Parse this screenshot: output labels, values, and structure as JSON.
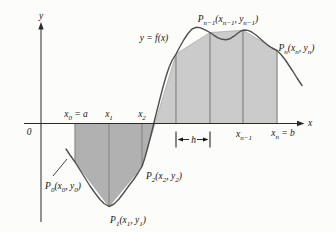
{
  "figure": {
    "colors": {
      "background": "#fcfcfa",
      "fill_below_axis": "#b1b1b1",
      "fill_above_axis": "#cbcbcb",
      "trapezoid_edge": "#8a8a8a",
      "chord_stroke": "#9a9a9a",
      "curve": "#4f4f4f",
      "axis": "#2a2a2a",
      "text": "#151515"
    },
    "axis": {
      "x_axis_y": 123.5,
      "y_axis_x": 41,
      "x_start": 24,
      "x_end": 301.5,
      "x_arrow_tip": 304.5,
      "y_bottom": 222,
      "y_top": 26,
      "y_arrow_tip": 22
    },
    "points": [
      {
        "name": "P0",
        "x": 75,
        "y": 162
      },
      {
        "name": "P1",
        "x": 109,
        "y": 206.5
      },
      {
        "name": "P2",
        "x": 142,
        "y": 166.5
      },
      {
        "name": "P3",
        "x": 176,
        "y": 54
      },
      {
        "name": "P4",
        "x": 210,
        "y": 32.5
      },
      {
        "name": "P5",
        "x": 243,
        "y": 30.3
      },
      {
        "name": "P6",
        "x": 277,
        "y": 50.5
      }
    ],
    "curve": [
      [
        66,
        149
      ],
      [
        70,
        155
      ],
      [
        75,
        162
      ],
      [
        80,
        170
      ],
      [
        85,
        178
      ],
      [
        90,
        186
      ],
      [
        95,
        193
      ],
      [
        100,
        199.5
      ],
      [
        104,
        203.5
      ],
      [
        109,
        206.5
      ],
      [
        114,
        204
      ],
      [
        119,
        199
      ],
      [
        124,
        192.5
      ],
      [
        129,
        185.5
      ],
      [
        134,
        179
      ],
      [
        138,
        173
      ],
      [
        142,
        166.5
      ],
      [
        145,
        157.5
      ],
      [
        148,
        146.5
      ],
      [
        151,
        135
      ],
      [
        154,
        122.5
      ],
      [
        157,
        110.5
      ],
      [
        160,
        98.5
      ],
      [
        163,
        87
      ],
      [
        166,
        76.5
      ],
      [
        169,
        67.5
      ],
      [
        172,
        60.5
      ],
      [
        176,
        54
      ],
      [
        180,
        46.5
      ],
      [
        184,
        39.5
      ],
      [
        188,
        33.5
      ],
      [
        192,
        29
      ],
      [
        196,
        27.3
      ],
      [
        200,
        27.6
      ],
      [
        205,
        29.8
      ],
      [
        210,
        32.5
      ],
      [
        214,
        35.3
      ],
      [
        218,
        37.8
      ],
      [
        222,
        39.3
      ],
      [
        226,
        39.7
      ],
      [
        230,
        38.7
      ],
      [
        234,
        36.2
      ],
      [
        238,
        33
      ],
      [
        241,
        31
      ],
      [
        244,
        30
      ],
      [
        248,
        30.4
      ],
      [
        252,
        32.2
      ],
      [
        256,
        35
      ],
      [
        260,
        38.5
      ],
      [
        264,
        42
      ],
      [
        268,
        45.3
      ],
      [
        272,
        48
      ],
      [
        277,
        50.5
      ],
      [
        281,
        54.5
      ],
      [
        285,
        59.5
      ],
      [
        289,
        65.5
      ],
      [
        293,
        71.5
      ],
      [
        297,
        78
      ],
      [
        300,
        82.5
      ],
      [
        302,
        85.5
      ]
    ],
    "h_marker": {
      "x1": 176,
      "x2": 210,
      "y_mid": 139.5,
      "bar_top": 131.5,
      "bar_bottom": 147.5,
      "label": "h"
    },
    "leader_line": {
      "x1": 53,
      "y1": 176,
      "x2": 67,
      "y2": 159
    },
    "labels": [
      {
        "name": "y-axis-label",
        "text": "y",
        "x": 41,
        "y": 15.5,
        "anchor": "middle"
      },
      {
        "name": "x-axis-label",
        "text": "x",
        "x": 308,
        "y": 122.5,
        "anchor": "start"
      },
      {
        "name": "origin-label",
        "text": "0",
        "x": 29,
        "y": 131.5,
        "anchor": "middle"
      },
      {
        "name": "curve-label",
        "text": "y = f(x)",
        "x": 154,
        "y": 37.5,
        "anchor": "middle"
      },
      {
        "name": "label-p0",
        "text": "P_{0}(x_{0}, y_{0})",
        "x": 63,
        "y": 186,
        "anchor": "middle"
      },
      {
        "name": "label-p1",
        "text": "P_{1}(x_{1}, y_{1})",
        "x": 128,
        "y": 219.5,
        "anchor": "middle"
      },
      {
        "name": "label-p2",
        "text": "P_{2}(x_{2}, y_{2})",
        "x": 146,
        "y": 175.5,
        "anchor": "start"
      },
      {
        "name": "label-pn-1",
        "text": "P_{n−1}(x_{n−1}, y_{n−1})",
        "x": 228,
        "y": 18.5,
        "anchor": "middle"
      },
      {
        "name": "label-pn",
        "text": "P_{n}(x_{n}, y_{n})",
        "x": 278.5,
        "y": 47.5,
        "anchor": "start"
      },
      {
        "name": "tick-label-x0",
        "text": "x_{0} = a",
        "x": 76,
        "y": 114,
        "anchor": "middle"
      },
      {
        "name": "tick-label-x1",
        "text": "x_{1}",
        "x": 109,
        "y": 114,
        "anchor": "middle"
      },
      {
        "name": "tick-label-x2",
        "text": "x_{2}",
        "x": 142,
        "y": 114,
        "anchor": "middle"
      },
      {
        "name": "tick-label-xn-1",
        "text": "x_{n−1}",
        "x": 244,
        "y": 133.5,
        "anchor": "middle"
      },
      {
        "name": "tick-label-xn",
        "text": "x_{n} = b",
        "x": 283,
        "y": 133,
        "anchor": "middle"
      },
      {
        "name": "h-label",
        "text": "h",
        "x": 193.5,
        "y": 139.5,
        "anchor": "middle"
      }
    ]
  }
}
